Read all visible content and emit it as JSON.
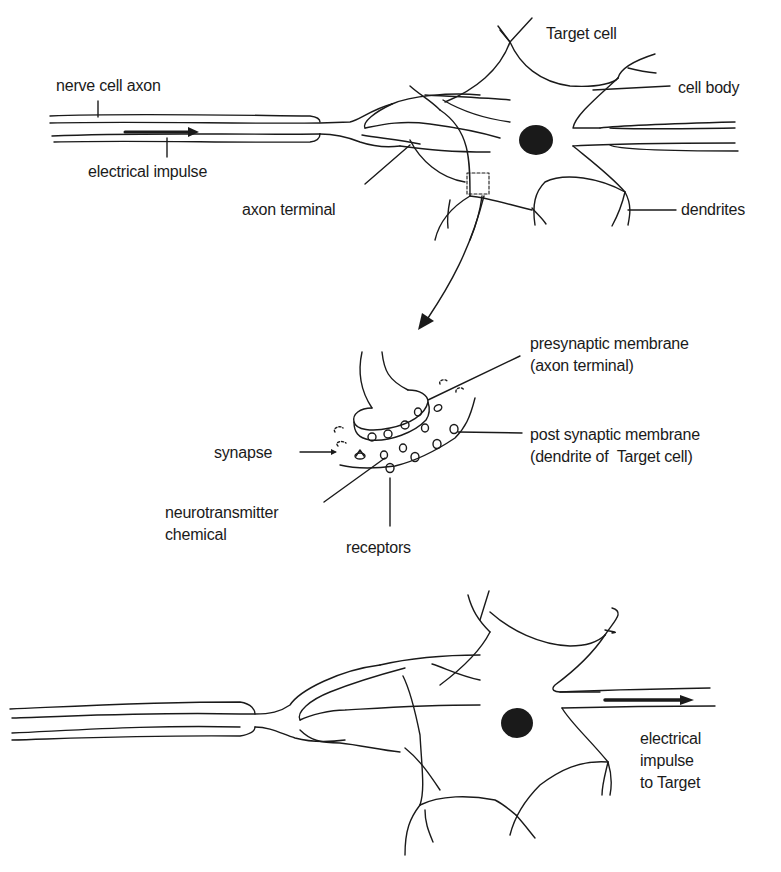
{
  "diagram": {
    "colors": {
      "ink": "#1a1a1a",
      "background": "#ffffff"
    },
    "top_panel": {
      "labels": {
        "nerve_cell_axon": "nerve cell axon",
        "electrical_impulse": "electrical impulse",
        "axon_terminal": "axon terminal",
        "target_cell": "Target cell",
        "cell_body": "cell body",
        "dendrites": "dendrites"
      }
    },
    "middle_panel": {
      "labels": {
        "presynaptic_membrane": "presynaptic membrane\n(axon terminal)",
        "post_synaptic_membrane": "post synaptic membrane\n(dendrite of  Target cell)",
        "synapse": "synapse",
        "neurotransmitter": "neurotransmitter\nchemical",
        "receptors": "receptors"
      }
    },
    "bottom_panel": {
      "labels": {
        "impulse_to_target": "electrical\nimpulse\nto Target"
      }
    }
  }
}
